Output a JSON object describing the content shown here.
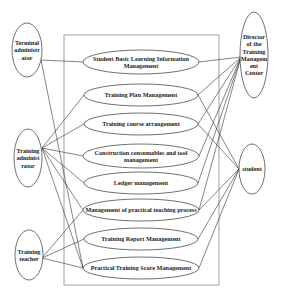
{
  "diagram": {
    "type": "use-case",
    "system_boundary": {
      "x": 64,
      "y": 35,
      "width": 155,
      "height": 250
    },
    "actors": [
      {
        "id": "terminal_admin",
        "lines": [
          "Terminal",
          "administr",
          "ator"
        ],
        "cx": 27,
        "cy": 50,
        "rx": 15,
        "ry": 27,
        "anchor": [
          41,
          60
        ]
      },
      {
        "id": "training_admin",
        "lines": [
          "Training",
          "administ",
          "rator"
        ],
        "cx": 28,
        "cy": 158,
        "rx": 14,
        "ry": 29,
        "anchor": [
          42,
          148
        ]
      },
      {
        "id": "training_teacher",
        "lines": [
          "Training",
          "teacher"
        ],
        "cx": 29,
        "cy": 255,
        "rx": 14,
        "ry": 25,
        "anchor": [
          42,
          258
        ]
      },
      {
        "id": "director",
        "lines": [
          "Director",
          "of the",
          "Training",
          "Managem",
          "ent",
          "Center"
        ],
        "cx": 254,
        "cy": 55,
        "rx": 14,
        "ry": 43,
        "anchor": [
          241,
          57
        ]
      },
      {
        "id": "student",
        "lines": [
          "student"
        ],
        "cx": 252,
        "cy": 169,
        "rx": 13,
        "ry": 25,
        "anchor": [
          239,
          169
        ]
      }
    ],
    "use_cases": [
      {
        "id": "uc1",
        "lines": [
          "Student Basic Learning Information",
          "Management"
        ],
        "cx": 141,
        "cy": 62,
        "rx": 58,
        "ry": 12
      },
      {
        "id": "uc2",
        "lines": [
          "Training Plan Management"
        ],
        "cx": 141,
        "cy": 95,
        "rx": 57,
        "ry": 11
      },
      {
        "id": "uc3",
        "lines": [
          "Training course arrangement"
        ],
        "cx": 141,
        "cy": 124,
        "rx": 57,
        "ry": 11
      },
      {
        "id": "uc4",
        "lines": [
          "Construction consumables and tool",
          "management"
        ],
        "cx": 141,
        "cy": 156,
        "rx": 58,
        "ry": 12
      },
      {
        "id": "uc5",
        "lines": [
          "Ledger management"
        ],
        "cx": 141,
        "cy": 183,
        "rx": 57,
        "ry": 11
      },
      {
        "id": "uc6",
        "lines": [
          "Management of practical teaching process"
        ],
        "cx": 141,
        "cy": 210,
        "rx": 58,
        "ry": 11
      },
      {
        "id": "uc7",
        "lines": [
          "Training Report Management"
        ],
        "cx": 141,
        "cy": 239,
        "rx": 57,
        "ry": 11
      },
      {
        "id": "uc8",
        "lines": [
          "Practical Training Score Management"
        ],
        "cx": 141,
        "cy": 268,
        "rx": 58,
        "ry": 11
      }
    ],
    "associations": [
      [
        "terminal_admin",
        "uc1"
      ],
      [
        "terminal_admin",
        "uc8"
      ],
      [
        "training_admin",
        "uc2"
      ],
      [
        "training_admin",
        "uc3"
      ],
      [
        "training_admin",
        "uc4"
      ],
      [
        "training_admin",
        "uc5"
      ],
      [
        "training_admin",
        "uc6"
      ],
      [
        "training_admin",
        "uc8"
      ],
      [
        "training_teacher",
        "uc6"
      ],
      [
        "training_teacher",
        "uc7"
      ],
      [
        "training_teacher",
        "uc8"
      ],
      [
        "director",
        "uc1"
      ],
      [
        "director",
        "uc2"
      ],
      [
        "director",
        "uc3"
      ],
      [
        "director",
        "uc4"
      ],
      [
        "director",
        "uc5"
      ],
      [
        "director",
        "uc6"
      ],
      [
        "student",
        "uc2"
      ],
      [
        "student",
        "uc3"
      ],
      [
        "student",
        "uc6"
      ],
      [
        "student",
        "uc7"
      ],
      [
        "student",
        "uc8"
      ]
    ],
    "colors": {
      "stroke": "#333333",
      "box": "#888888",
      "text": "#222222",
      "background": "#ffffff"
    }
  }
}
